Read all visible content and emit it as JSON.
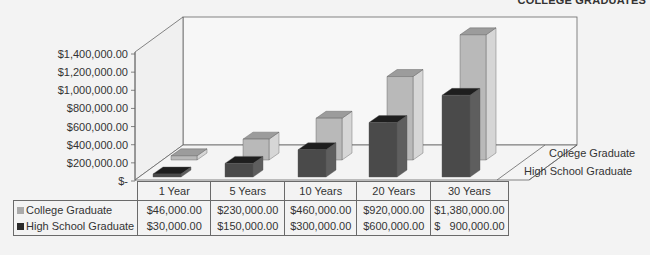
{
  "header": {
    "corner_title": "COLLEGE GRADUATES"
  },
  "colors": {
    "college": "#b9b9b9",
    "college_top": "#9c9c9c",
    "college_side": "#d6d6d6",
    "hs": "#4a4a4a",
    "hs_top": "#1e1e1e",
    "hs_side": "#5e5e5e"
  },
  "chart_data": {
    "type": "bar",
    "title": "",
    "categories": [
      "1 Year",
      "5 Years",
      "10 Years",
      "20 Years",
      "30 Years"
    ],
    "series": [
      {
        "name": "College Graduate",
        "values": [
          46000,
          230000,
          460000,
          920000,
          1380000
        ]
      },
      {
        "name": "High School Graduate",
        "values": [
          30000,
          150000,
          300000,
          600000,
          900000
        ]
      }
    ],
    "xlabel": "",
    "ylabel": "",
    "ylim": [
      0,
      1400000
    ],
    "yticks": [
      "$-",
      "$200,000.00",
      "$400,000.00",
      "$600,000.00",
      "$800,000.00",
      "$1,000,000.00",
      "$1,200,000.00",
      "$1,400,000.00"
    ],
    "grid": false,
    "legend_position": "right (depth axis labels)",
    "style": "3D clustered column with data table"
  },
  "axis": {
    "yticks": [
      "$-",
      "$200,000.00",
      "$400,000.00",
      "$600,000.00",
      "$800,000.00",
      "$1,000,000.00",
      "$1,200,000.00",
      "$1,400,000.00"
    ],
    "depth_labels": [
      "College Graduate",
      "High School Graduate"
    ]
  },
  "table": {
    "headers": [
      "1 Year",
      "5 Years",
      "10 Years",
      "20 Years",
      "30 Years"
    ],
    "rows": [
      {
        "label": "College Graduate",
        "cells": [
          "$46,000.00",
          "$230,000.00",
          "$460,000.00",
          "$920,000.00",
          "$1,380,000.00"
        ]
      },
      {
        "label": "High School Graduate",
        "cells": [
          "$30,000.00",
          "$150,000.00",
          "$300,000.00",
          "$600,000.00",
          "$   900,000.00"
        ]
      }
    ]
  }
}
